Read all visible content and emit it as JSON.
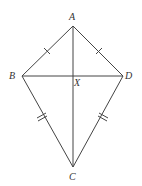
{
  "diagram": {
    "type": "kite",
    "stroke_color": "#444444",
    "label_color": "#333333",
    "points": {
      "A": {
        "x": 73,
        "y": 26
      },
      "B": {
        "x": 22,
        "y": 76
      },
      "D": {
        "x": 123,
        "y": 76
      },
      "C": {
        "x": 73,
        "y": 167
      },
      "X": {
        "x": 73,
        "y": 76
      }
    },
    "labels": {
      "A": "A",
      "B": "B",
      "C": "C",
      "D": "D",
      "X": "X"
    },
    "sides": [
      {
        "from": "A",
        "to": "B",
        "ticks": 1
      },
      {
        "from": "A",
        "to": "D",
        "ticks": 1
      },
      {
        "from": "B",
        "to": "C",
        "ticks": 2
      },
      {
        "from": "D",
        "to": "C",
        "ticks": 2
      }
    ],
    "diagonals": [
      {
        "from": "A",
        "to": "C"
      },
      {
        "from": "B",
        "to": "D"
      }
    ]
  }
}
